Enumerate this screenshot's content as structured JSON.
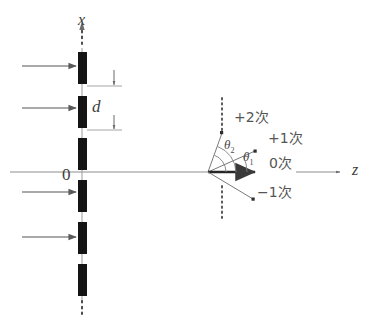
{
  "figure": {
    "background_color": "#ffffff",
    "line_color": "#6b6b6b",
    "bar_color": "#1a1a1a",
    "text_color": "#4a4a4a"
  },
  "axes": {
    "x_axis_label": "x",
    "z_axis_label": "z",
    "origin_label": "0"
  },
  "grating": {
    "period_label": "d",
    "bar_count": 6,
    "bar_color": "#141414",
    "bars": [
      {
        "x": 78,
        "y": 52,
        "w": 9,
        "h": 32
      },
      {
        "x": 78,
        "y": 96,
        "w": 9,
        "h": 32
      },
      {
        "x": 78,
        "y": 138,
        "w": 9,
        "h": 32
      },
      {
        "x": 78,
        "y": 180,
        "w": 9,
        "h": 32
      },
      {
        "x": 78,
        "y": 222,
        "w": 9,
        "h": 32
      },
      {
        "x": 78,
        "y": 264,
        "w": 9,
        "h": 32
      }
    ]
  },
  "incident_beams": {
    "count": 4,
    "arrow_label": "incident plane wave",
    "arrows": [
      {
        "x1": 22,
        "y1": 66,
        "x2": 74,
        "y2": 66
      },
      {
        "x1": 22,
        "y1": 108,
        "x2": 74,
        "y2": 108
      },
      {
        "x1": 22,
        "y1": 192,
        "x2": 74,
        "y2": 192
      },
      {
        "x1": 22,
        "y1": 237,
        "x2": 74,
        "y2": 237
      }
    ]
  },
  "orders": [
    {
      "name": "order-plus-2",
      "label": "+2次",
      "label_x": 234,
      "label_y": 116,
      "tip_x": 222,
      "tip_y": 133
    },
    {
      "name": "order-plus-1",
      "label": "+1次",
      "label_x": 268,
      "label_y": 137,
      "tip_x": 255,
      "tip_y": 151
    },
    {
      "name": "order-zero",
      "label": "0次",
      "label_x": 269,
      "label_y": 161,
      "tip_x": 261,
      "tip_y": 172
    },
    {
      "name": "order-minus-1",
      "label": "−1次",
      "label_x": 257,
      "label_y": 190,
      "tip_x": 253,
      "tip_y": 199
    }
  ],
  "angles": [
    {
      "name": "theta-2",
      "symbol": "θ",
      "subscript": "2",
      "label_x": 226,
      "label_y": 143
    },
    {
      "name": "theta-1",
      "symbol": "θ",
      "subscript": "1",
      "label_x": 244,
      "label_y": 155
    }
  ],
  "vertex": {
    "x": 208,
    "y": 172
  },
  "dotted_marks": {
    "top_of_grating_x": 82,
    "top_of_grating_y1": 22,
    "top_of_grating_y2": 48,
    "bottom_of_grating_x": 82,
    "bottom_of_grating_y1": 300,
    "bottom_of_grating_y2": 312,
    "screen_x": 222,
    "screen_upper_y1": 98,
    "screen_upper_y2": 130,
    "screen_lower_y1": 185,
    "screen_lower_y2": 218
  }
}
